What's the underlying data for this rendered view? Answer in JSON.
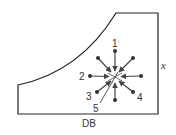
{
  "diagram": {
    "colors": {
      "outline": "#222222",
      "spoke": "#444444",
      "text": "#333333",
      "background": "#ffffff"
    },
    "labels": {
      "bottom": "DB",
      "right": "x",
      "spoke_1": "1",
      "spoke_2": "2",
      "spoke_3": "3",
      "spoke_4": "4",
      "spoke_5": "5"
    },
    "star_center": [
      115,
      77
    ],
    "spokes": [
      {
        "id": "top",
        "end": [
          115,
          51
        ]
      },
      {
        "id": "upper-right",
        "end": [
          133,
          58
        ]
      },
      {
        "id": "right",
        "end": [
          141,
          76
        ]
      },
      {
        "id": "lower-right",
        "end": [
          133,
          92
        ]
      },
      {
        "id": "bottom",
        "end": [
          115,
          100
        ]
      },
      {
        "id": "lower-left",
        "end": [
          97,
          92
        ]
      },
      {
        "id": "left",
        "end": [
          90,
          76
        ]
      },
      {
        "id": "upper-left",
        "end": [
          98,
          58
        ]
      }
    ]
  }
}
